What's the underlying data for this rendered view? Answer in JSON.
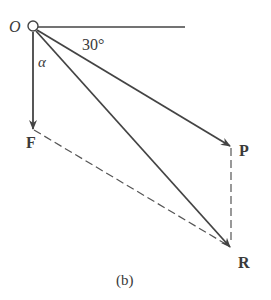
{
  "figure": {
    "caption": "(b)",
    "origin_label": "O",
    "angle_label": "30°",
    "alpha_label": "α",
    "vectors": {
      "F": {
        "label": "F"
      },
      "P": {
        "label": "P"
      },
      "R": {
        "label": "R"
      }
    }
  },
  "colors": {
    "stroke": "#444444",
    "text": "#3a3a3a",
    "background": "#ffffff"
  }
}
